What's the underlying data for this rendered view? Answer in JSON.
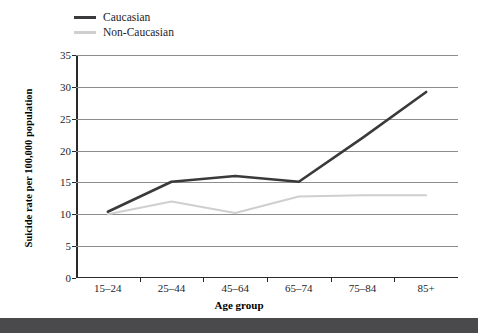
{
  "chart_data": {
    "type": "line",
    "title": "",
    "xlabel": "Age group",
    "ylabel": "Suicide rate per 100,000 population",
    "categories": [
      "15–24",
      "25–44",
      "45–64",
      "65–74",
      "75–84",
      "85+"
    ],
    "ylim": [
      0,
      35
    ],
    "yticks": [
      0,
      5,
      10,
      15,
      20,
      25,
      30,
      35
    ],
    "ytick_labels": [
      "0",
      "5",
      "10",
      "15",
      "20",
      "25",
      "30",
      "35"
    ],
    "grid": true,
    "legend_position": "top-left",
    "series": [
      {
        "name": "Caucasian",
        "color": "#3a3a3c",
        "values": [
          10.4,
          15.1,
          16.0,
          15.1,
          22.0,
          29.2
        ]
      },
      {
        "name": "Non-Caucasian",
        "color": "#cfcfcf",
        "values": [
          10.0,
          12.0,
          10.2,
          12.8,
          13.0,
          13.0
        ]
      }
    ]
  },
  "legend": {
    "items": [
      {
        "label": "Caucasian",
        "swatch": "caucasian"
      },
      {
        "label": "Non-Caucasian",
        "swatch": "noncaucasian"
      }
    ]
  },
  "axis": {
    "y_title": "Suicide rate per 100,000 population",
    "x_title": "Age group"
  }
}
